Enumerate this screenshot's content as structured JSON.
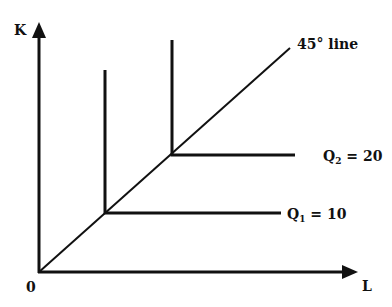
{
  "diagram": {
    "axes": {
      "y_label": "K",
      "x_label": "L",
      "origin_label": "0"
    },
    "ray_label": "45° line",
    "isoquants": [
      {
        "name": "Q",
        "sub": "1",
        "value_text": " = 10",
        "kink": [
          105,
          213
        ],
        "top_y": 70,
        "right_x": 281
      },
      {
        "name": "Q",
        "sub": "2",
        "value_text": " = 20",
        "kink": [
          172,
          155
        ],
        "top_y": 40,
        "right_x": 295
      }
    ],
    "colors": {
      "ink": "#111111",
      "background": "#ffffff"
    }
  }
}
